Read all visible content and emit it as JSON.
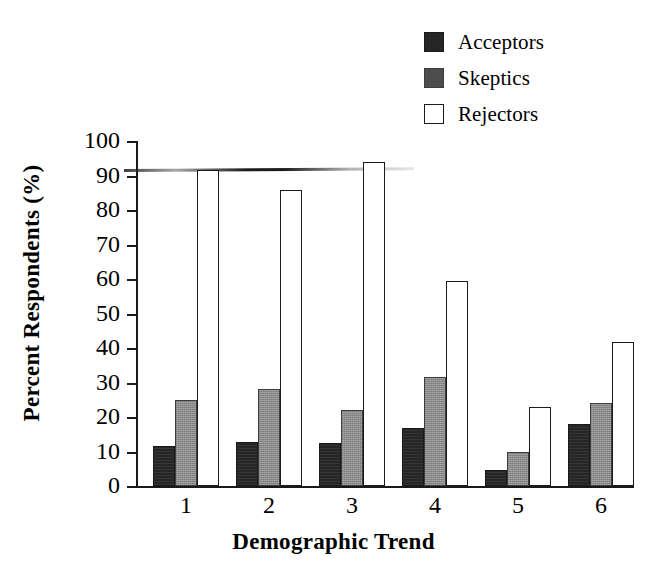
{
  "chart_data": {
    "type": "bar",
    "title": "",
    "xlabel": "Demographic Trend",
    "ylabel": "Percent Respondents (%)",
    "categories": [
      "1",
      "2",
      "3",
      "4",
      "5",
      "6"
    ],
    "ylim": [
      0,
      100
    ],
    "yticks": [
      0,
      10,
      20,
      30,
      40,
      50,
      60,
      70,
      80,
      90,
      100
    ],
    "ytick_labels": [
      "0",
      "10",
      "20",
      "30",
      "40",
      "50",
      "60",
      "70",
      "80",
      "90",
      "100"
    ],
    "grid": false,
    "legend_position": "top-right",
    "series": [
      {
        "name": "Acceptors",
        "color": "#262626",
        "values": [
          11.5,
          12.8,
          12.6,
          16.7,
          4.5,
          18.1
        ]
      },
      {
        "name": "Skeptics",
        "color": "#8a8a8a",
        "values": [
          25.0,
          28.0,
          22.0,
          31.5,
          9.8,
          24.1
        ]
      },
      {
        "name": "Rejectors",
        "color": "#ffffff",
        "values": [
          91.5,
          85.8,
          93.8,
          59.4,
          22.8,
          41.8
        ]
      }
    ],
    "annotations": [
      "horizontal scan smear artifact near 91%"
    ]
  },
  "legend": {
    "items": [
      {
        "label": "Acceptors",
        "swatch": "#262626",
        "border": "#1a1a1a"
      },
      {
        "label": "Skeptics",
        "swatch": "#8a8a8a",
        "border": "#3d3d3d"
      },
      {
        "label": "Rejectors",
        "swatch": "#ffffff",
        "border": "#1a1a1a"
      }
    ]
  },
  "axes": {
    "y_title": "Percent Respondents (%)",
    "x_title": "Demographic Trend",
    "y_labels": [
      "100",
      "90",
      "80",
      "70",
      "60",
      "50",
      "40",
      "30",
      "20",
      "10",
      "0"
    ],
    "x_labels": [
      "1",
      "2",
      "3",
      "4",
      "5",
      "6"
    ]
  },
  "colors": {
    "axis": "#1a1a1a",
    "acceptors": "#262626",
    "skeptics": "#8a8a8a",
    "rejectors": "#ffffff",
    "background": "#ffffff"
  }
}
